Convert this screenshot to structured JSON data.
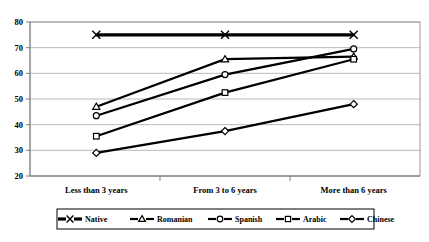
{
  "chart_data": {
    "type": "line",
    "title": "",
    "subtitle": "",
    "xlabel": "",
    "ylabel": "",
    "categories": [
      "Less than 3 years",
      "From 3 to 6 years",
      "More than 6 years"
    ],
    "ylim": [
      20,
      80
    ],
    "yticks": [
      20,
      30,
      40,
      50,
      60,
      70,
      80
    ],
    "ytick_labels": [
      "20",
      "30",
      "40",
      "50",
      "60",
      "70",
      "80"
    ],
    "grid": true,
    "grid_axis": "y",
    "legend_position": "bottom",
    "series": [
      {
        "name": "Native",
        "marker": "x-marker",
        "values": [
          75,
          75,
          75
        ]
      },
      {
        "name": "Romanian",
        "marker": "triangle-marker",
        "values": [
          47,
          65.5,
          66.5
        ]
      },
      {
        "name": "Spanish",
        "marker": "circle-marker",
        "values": [
          43.5,
          59.5,
          69.5
        ]
      },
      {
        "name": "Arabic",
        "marker": "square-marker",
        "values": [
          35.5,
          52.5,
          65.5
        ]
      },
      {
        "name": "Chinese",
        "marker": "diamond-marker",
        "values": [
          29,
          37.5,
          48
        ]
      }
    ],
    "colors": {
      "line": "#000000",
      "marker_fill": "#ffffff",
      "gridline": "#a6a6a6",
      "axis": "#808080",
      "background": "#ffffff"
    }
  },
  "legend": {
    "entries": [
      {
        "label": "Native"
      },
      {
        "label": "Romanian"
      },
      {
        "label": "Spanish"
      },
      {
        "label": "Arabic"
      },
      {
        "label": "Chinese"
      }
    ]
  },
  "axis": {
    "y_tick_labels": [
      "80",
      "70",
      "60",
      "50",
      "40",
      "30",
      "20"
    ],
    "x_tick_labels": [
      "Less than 3 years",
      "From 3 to 6 years",
      "More than 6 years"
    ]
  }
}
